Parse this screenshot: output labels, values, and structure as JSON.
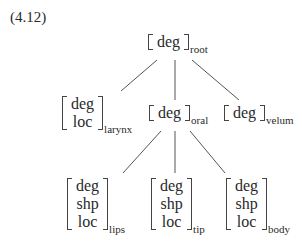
{
  "example_label": "(4.12)",
  "tree": {
    "root": {
      "features": [
        "deg"
      ],
      "subscript": "root"
    },
    "children": [
      {
        "id": "larynx",
        "features": [
          "deg",
          "loc"
        ],
        "subscript": "larynx"
      },
      {
        "id": "oral",
        "features": [
          "deg"
        ],
        "subscript": "oral",
        "children": [
          {
            "id": "lips",
            "features": [
              "deg",
              "shp",
              "loc"
            ],
            "subscript": "lips"
          },
          {
            "id": "tip",
            "features": [
              "deg",
              "shp",
              "loc"
            ],
            "subscript": "tip"
          },
          {
            "id": "body",
            "features": [
              "deg",
              "shp",
              "loc"
            ],
            "subscript": "body"
          }
        ]
      },
      {
        "id": "velum",
        "features": [
          "deg"
        ],
        "subscript": "velum"
      }
    ]
  },
  "colors": {
    "text": "#2a2a2a",
    "lines": "#555555",
    "background": "#ffffff"
  }
}
